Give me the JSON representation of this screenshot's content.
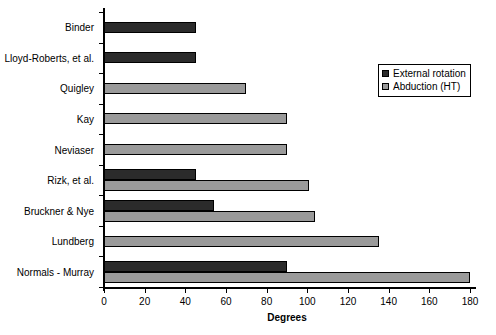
{
  "chart_data": {
    "type": "bar",
    "orientation": "horizontal",
    "title": "",
    "xlabel": "Degrees",
    "ylabel": "",
    "xlim": [
      0,
      180
    ],
    "xticks": [
      0,
      20,
      40,
      60,
      80,
      100,
      120,
      140,
      160,
      180
    ],
    "grid": false,
    "legend_position": "upper right",
    "categories": [
      "Binder",
      "Lloyd-Roberts, et al.",
      "Quigley",
      "Kay",
      "Neviaser",
      "Rizk, et al.",
      "Bruckner & Nye",
      "Lundberg",
      "Normals - Murray"
    ],
    "series": [
      {
        "name": "External rotation",
        "color": "#2b2b2b",
        "values": [
          45,
          45,
          null,
          null,
          null,
          45,
          54,
          null,
          90
        ]
      },
      {
        "name": "Abduction (HT)",
        "color": "#9a9a9a",
        "values": [
          null,
          null,
          70,
          90,
          90,
          101,
          104,
          135,
          180
        ]
      }
    ]
  },
  "legend": {
    "items": [
      {
        "label": "External rotation",
        "swatch": "dark-square-icon"
      },
      {
        "label": "Abduction (HT)",
        "swatch": "light-square-icon"
      }
    ]
  }
}
